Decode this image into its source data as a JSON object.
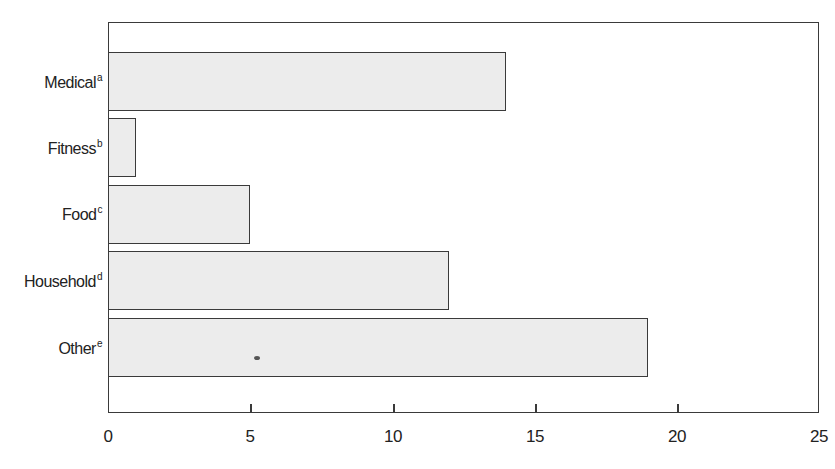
{
  "chart_data": {
    "type": "bar",
    "orientation": "horizontal",
    "title": "",
    "xlabel": "",
    "ylabel": "",
    "categories": [
      "Medical",
      "Fitness",
      "Food",
      "Household",
      "Other"
    ],
    "category_superscripts": [
      "a",
      "b",
      "c",
      "d",
      "e"
    ],
    "values": [
      14,
      1,
      5,
      12,
      19
    ],
    "xlim": [
      0,
      25
    ],
    "x_ticks": [
      0,
      5,
      10,
      15,
      20,
      25
    ],
    "grid": false,
    "legend": null,
    "bar_fill": "#ececec",
    "bar_edge": "#3a3a3a"
  },
  "labels": {
    "cat0": "Medical",
    "sup0": "a",
    "cat1": "Fitness",
    "sup1": "b",
    "cat2": "Food",
    "sup2": "c",
    "cat3": "Household",
    "sup3": "d",
    "cat4": "Other",
    "sup4": "e",
    "tick0": "0",
    "tick1": "5",
    "tick2": "10",
    "tick3": "15",
    "tick4": "20",
    "tick5": "25"
  }
}
